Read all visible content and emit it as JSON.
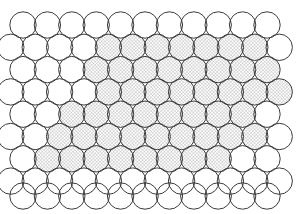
{
  "figure": {
    "background_color": "#ffffff",
    "outline_color": "#3c3c3c",
    "hatch_color": "#8c8c8c",
    "hatch_fill_background": "#ffffff",
    "outline_width": 1.0,
    "canvas": {
      "width": 304,
      "height": 214
    }
  },
  "lattice": {
    "circle_radius": 13.2,
    "circle_diameter": 26.4,
    "row_step_y": 22.3,
    "column_step_x": 24.4,
    "row_count": 9,
    "odd_row_count": 11,
    "even_row_count": 12,
    "odd_row_first_center_x": 23.0,
    "even_row_first_center_x": 10.8,
    "first_row_center_y": 25.0
  },
  "hatch_pattern": {
    "type": "cross-hatch",
    "angle_deg": 45,
    "spacing_px": 2.4,
    "line_width": 0.55,
    "color": "#8c8c8c"
  },
  "rows": [
    {
      "index": 1,
      "center_y": 25.0,
      "parity": "odd",
      "count": 11,
      "hatched": []
    },
    {
      "index": 2,
      "center_y": 47.3,
      "parity": "even",
      "count": 12,
      "hatched": [
        5,
        6,
        7,
        8,
        9,
        10,
        11
      ]
    },
    {
      "index": 3,
      "center_y": 69.6,
      "parity": "odd",
      "count": 11,
      "hatched": [
        4,
        5,
        6,
        7,
        8,
        9,
        10,
        11
      ]
    },
    {
      "index": 4,
      "center_y": 91.9,
      "parity": "even",
      "count": 12,
      "hatched": [
        5,
        6,
        7,
        8,
        9,
        10,
        11,
        12
      ]
    },
    {
      "index": 5,
      "center_y": 114.2,
      "parity": "odd",
      "count": 11,
      "hatched": [
        3,
        4,
        5,
        6,
        7,
        8,
        9,
        10
      ]
    },
    {
      "index": 6,
      "center_y": 136.5,
      "parity": "even",
      "count": 12,
      "hatched": [
        3,
        4,
        5,
        6,
        7,
        8,
        9,
        10,
        11
      ]
    },
    {
      "index": 7,
      "center_y": 158.8,
      "parity": "odd",
      "count": 11,
      "hatched": [
        2,
        3,
        4,
        5,
        6,
        7,
        8,
        9
      ]
    },
    {
      "index": 8,
      "center_y": 181.1,
      "parity": "even",
      "count": 12,
      "hatched": []
    },
    {
      "index": 9,
      "center_y": 196.0,
      "parity": "odd",
      "count": 11,
      "hatched": []
    }
  ],
  "counts": {
    "total_circles": 103,
    "hatched_circles": 48,
    "empty_circles": 55
  }
}
